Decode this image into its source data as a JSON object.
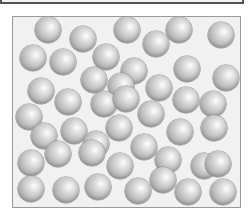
{
  "figure": {
    "container": {
      "fill": "#f1f1f1",
      "border": "#9a9a9a"
    },
    "sphere_color": "#bdbdbd",
    "sphere_radius_px": 13,
    "spheres": [
      {
        "x": 47,
        "y": 29
      },
      {
        "x": 82,
        "y": 38
      },
      {
        "x": 126,
        "y": 29
      },
      {
        "x": 155,
        "y": 43
      },
      {
        "x": 178,
        "y": 29
      },
      {
        "x": 220,
        "y": 34
      },
      {
        "x": 32,
        "y": 57
      },
      {
        "x": 62,
        "y": 61
      },
      {
        "x": 105,
        "y": 56
      },
      {
        "x": 133,
        "y": 70
      },
      {
        "x": 186,
        "y": 68
      },
      {
        "x": 225,
        "y": 77
      },
      {
        "x": 40,
        "y": 90
      },
      {
        "x": 93,
        "y": 79
      },
      {
        "x": 120,
        "y": 85
      },
      {
        "x": 158,
        "y": 87
      },
      {
        "x": 185,
        "y": 99
      },
      {
        "x": 212,
        "y": 103
      },
      {
        "x": 67,
        "y": 101
      },
      {
        "x": 103,
        "y": 103
      },
      {
        "x": 125,
        "y": 98
      },
      {
        "x": 150,
        "y": 113
      },
      {
        "x": 28,
        "y": 116
      },
      {
        "x": 43,
        "y": 135
      },
      {
        "x": 73,
        "y": 130
      },
      {
        "x": 118,
        "y": 127
      },
      {
        "x": 143,
        "y": 146
      },
      {
        "x": 179,
        "y": 131
      },
      {
        "x": 213,
        "y": 127
      },
      {
        "x": 95,
        "y": 143
      },
      {
        "x": 57,
        "y": 153
      },
      {
        "x": 30,
        "y": 162
      },
      {
        "x": 91,
        "y": 152
      },
      {
        "x": 119,
        "y": 165
      },
      {
        "x": 167,
        "y": 159
      },
      {
        "x": 203,
        "y": 165
      },
      {
        "x": 217,
        "y": 163
      },
      {
        "x": 30,
        "y": 188
      },
      {
        "x": 65,
        "y": 189
      },
      {
        "x": 97,
        "y": 186
      },
      {
        "x": 137,
        "y": 190
      },
      {
        "x": 162,
        "y": 179
      },
      {
        "x": 187,
        "y": 191
      },
      {
        "x": 222,
        "y": 191
      }
    ]
  }
}
